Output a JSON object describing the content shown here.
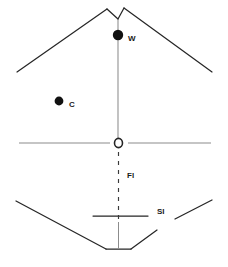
{
  "figure": {
    "type": "line-diagram",
    "background_color": "#ffffff",
    "stroke_color": "#262626",
    "axis_color": "#8c8c8c",
    "marker_fill": "#111111",
    "labels": {
      "w": "W",
      "c": "C",
      "fl": "Fl",
      "si": "SI"
    },
    "markers": [
      {
        "id": "w-marker",
        "shape": "filled-circle",
        "x": 118,
        "y": 35,
        "r": 5.2,
        "label": "W"
      },
      {
        "id": "c-marker",
        "shape": "filled-circle",
        "x": 59,
        "y": 101,
        "r": 4.4,
        "label": "C"
      },
      {
        "id": "o-marker",
        "shape": "open-circle",
        "x": 118.5,
        "y": 143,
        "rx": 4.0,
        "ry": 4.6,
        "label": ""
      }
    ],
    "strokes": [
      {
        "id": "apex-notch-left",
        "points": "107,9 118,19"
      },
      {
        "id": "apex-notch-right",
        "points": "118,19 124,8"
      },
      {
        "id": "roof-left",
        "points": "107,9 17,72"
      },
      {
        "id": "roof-right",
        "points": "124,8 212,72"
      },
      {
        "id": "center-axis-upper",
        "points": "118,19 118,140"
      },
      {
        "id": "center-axis-lower",
        "points": "118.5,222 118.5,249"
      },
      {
        "id": "midline-left",
        "points": "19,143 110,143"
      },
      {
        "id": "midline-right",
        "points": "128,143 211,143"
      },
      {
        "id": "si-bar",
        "points": "93,216 148,216"
      },
      {
        "id": "floor-left",
        "points": "16,201 106,249"
      },
      {
        "id": "floor-bottom",
        "points": "106,249 131,249"
      },
      {
        "id": "floor-right-lower",
        "points": "131,249 157,230"
      },
      {
        "id": "floor-right-upper",
        "points": "175,219 212,200"
      }
    ],
    "dashed_strokes": [
      {
        "id": "fl-dashed-axis",
        "points": "118.5,152 118.5,219",
        "dash": "4,5"
      }
    ]
  }
}
